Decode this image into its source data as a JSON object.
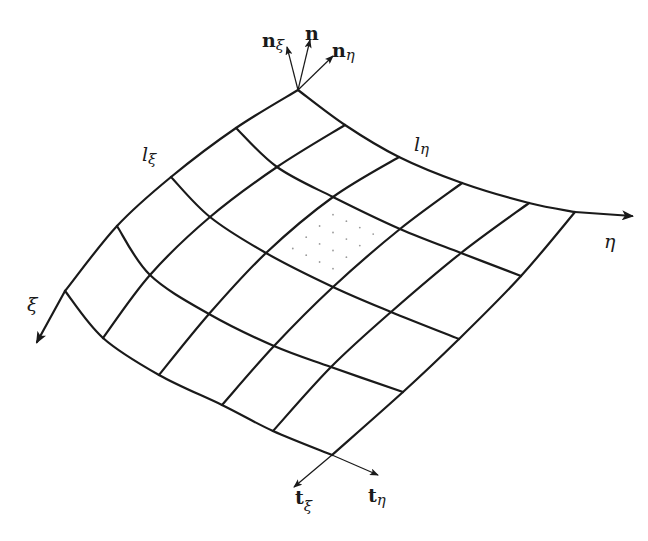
{
  "figure": {
    "grid": {
      "rows_xi": 4,
      "cols_eta": 5,
      "nodes": [
        [
          [
            298,
            90
          ],
          [
            345,
            125
          ],
          [
            399,
            157
          ],
          [
            462,
            183
          ],
          [
            529,
            203
          ],
          [
            575,
            212
          ]
        ],
        [
          [
            236,
            128
          ],
          [
            277,
            167
          ],
          [
            333,
            197
          ],
          [
            400,
            229
          ],
          [
            461,
            253
          ],
          [
            521,
            276
          ]
        ],
        [
          [
            171,
            177
          ],
          [
            210,
            217
          ],
          [
            266,
            253
          ],
          [
            333,
            287
          ],
          [
            391,
            312
          ],
          [
            459,
            339
          ]
        ],
        [
          [
            117,
            226
          ],
          [
            150,
            275
          ],
          [
            209,
            314
          ],
          [
            274,
            346
          ],
          [
            331,
            367
          ],
          [
            403,
            392
          ]
        ],
        [
          [
            65,
            291
          ],
          [
            103,
            338
          ],
          [
            159,
            375
          ],
          [
            222,
            405
          ],
          [
            273,
            431
          ],
          [
            332,
            455
          ]
        ]
      ],
      "highlighted_cell": {
        "row": 1,
        "col": 2,
        "style": "dotted"
      }
    },
    "axes": {
      "eta": {
        "symbol": "η",
        "from": [
          575,
          212
        ],
        "to": [
          632,
          216
        ]
      },
      "xi": {
        "symbol": "ξ",
        "from": [
          65,
          291
        ],
        "to": [
          37,
          342
        ]
      }
    },
    "edge_labels": {
      "l_xi": {
        "main": "l",
        "sub": "ξ"
      },
      "l_eta": {
        "main": "l",
        "sub": "η"
      }
    },
    "normals": {
      "origin": [
        298,
        90
      ],
      "n_xi": {
        "main": "n",
        "sub": "ξ",
        "tip": [
          287,
          47
        ]
      },
      "n": {
        "main": "n",
        "sub": "",
        "tip": [
          310,
          40
        ]
      },
      "n_eta": {
        "main": "n",
        "sub": "η",
        "tip": [
          333,
          56
        ]
      }
    },
    "tangents": {
      "origin": [
        332,
        455
      ],
      "t_xi": {
        "main": "t",
        "sub": "ξ",
        "tip": [
          294,
          487
        ]
      },
      "t_eta": {
        "main": "t",
        "sub": "η",
        "tip": [
          378,
          475
        ]
      }
    },
    "colors": {
      "stroke": "#1a1a1a",
      "background": "#ffffff",
      "dots": "#9a9a9a"
    }
  }
}
